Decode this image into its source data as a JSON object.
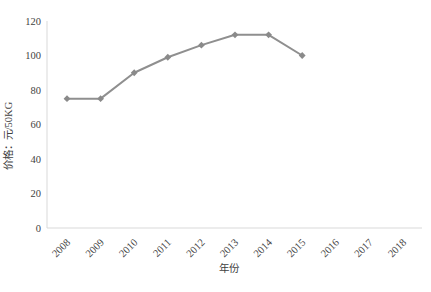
{
  "chart_data": {
    "type": "line",
    "categories": [
      "2008",
      "2009",
      "2010",
      "2011",
      "2012",
      "2013",
      "2014",
      "2015",
      "2016",
      "2017",
      "2018"
    ],
    "values": [
      75,
      75,
      90,
      99,
      106,
      112,
      112,
      100,
      null,
      null,
      null
    ],
    "title": "",
    "xlabel": "年份",
    "ylabel": "价格：元/50KG",
    "ylim": [
      0,
      120
    ],
    "yticks": [
      0,
      20,
      40,
      60,
      80,
      100,
      120
    ],
    "grid": false,
    "legend": false,
    "marker": "diamond",
    "line_color": "#8f8f8f",
    "marker_color": "#8a8a8a",
    "axis_color": "#d9d9d9",
    "text_color": "#3f3f3f"
  }
}
